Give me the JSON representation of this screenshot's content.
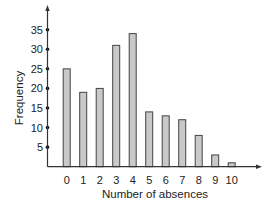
{
  "chart_data": {
    "type": "bar",
    "title": "",
    "xlabel": "Number of absences",
    "ylabel": "Frequency",
    "categories": [
      "0",
      "1",
      "2",
      "3",
      "4",
      "5",
      "6",
      "7",
      "8",
      "9",
      "10"
    ],
    "values": [
      25,
      19,
      20,
      31,
      34,
      14,
      13,
      12,
      8,
      3,
      1
    ],
    "ylim": [
      0,
      35
    ],
    "yticks": [
      5,
      10,
      15,
      20,
      25,
      30,
      35
    ],
    "grid": false,
    "legend": null,
    "colors": {
      "bar_fill": "#c9c9c9",
      "bar_stroke": "#444444",
      "axis": "#333333"
    }
  }
}
